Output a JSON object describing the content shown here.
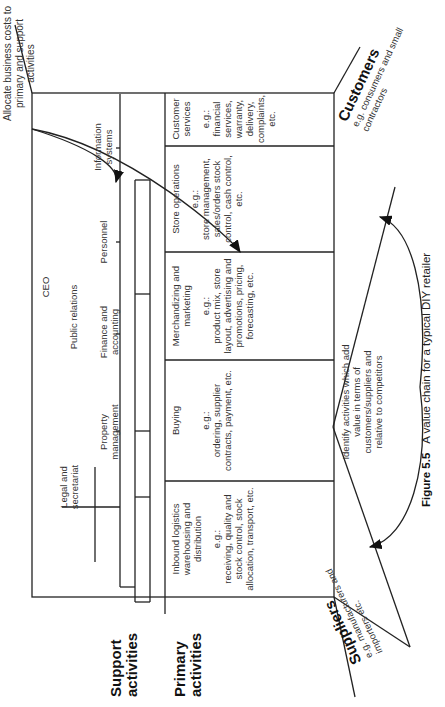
{
  "header_note": "Allocate business costs to primary and support activities",
  "support_activities": {
    "label": "Support activities",
    "ceo": "CEO",
    "legal": "Legal and secretariat",
    "public_relations": "Public relations",
    "functions": [
      {
        "label": "Property management"
      },
      {
        "label": "Finance and accounting"
      },
      {
        "label": "Personnel"
      },
      {
        "label": "Information systems"
      }
    ]
  },
  "primary_activities": {
    "label": "Primary activities",
    "columns": [
      {
        "title": "Inbound logistics warehousing and distribution",
        "example_prefix": "e.g.:",
        "examples": "receiving, quality and stock control, stock allocation, transport, etc."
      },
      {
        "title": "Buying",
        "example_prefix": "e.g.:",
        "examples": "ordering, supplier contracts, payment, etc."
      },
      {
        "title": "Merchandizing and marketing",
        "example_prefix": "e.g.:",
        "examples": "product mix, store layout, advertising and promotions, pricing, forecasting, etc."
      },
      {
        "title": "Store operations",
        "example_prefix": "e.g.:",
        "examples": "store management, sales/orders stock control, cash control, etc."
      },
      {
        "title": "Customer services",
        "example_prefix": "e.g.:",
        "examples": "financial services, warranty, delivery, complaints, etc."
      }
    ]
  },
  "suppliers": {
    "label": "Suppliers",
    "detail": "e.g. manufacturers and importers etc."
  },
  "customers": {
    "label": "Customers",
    "detail": "e.g. consumers and small contractors"
  },
  "identify_note": "Identify activities which add value in terms of customers/suppliers and relative to competitors",
  "caption": {
    "figure": "Figure 5.5",
    "text": "A value chain for a typical DIY retailer"
  }
}
